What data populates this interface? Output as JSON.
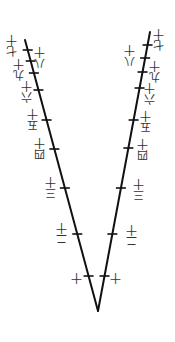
{
  "diagram": {
    "line_color": "#111111",
    "vertex": [
      98,
      311
    ],
    "left_arm_top": [
      25,
      40
    ],
    "right_arm_top": [
      150,
      32
    ],
    "left_ticks": [
      {
        "y": 50,
        "x": 28
      },
      {
        "y": 61,
        "x": 31
      },
      {
        "y": 73,
        "x": 34
      },
      {
        "y": 90,
        "x": 39
      },
      {
        "y": 120,
        "x": 47
      },
      {
        "y": 149,
        "x": 55
      },
      {
        "y": 188,
        "x": 65
      },
      {
        "y": 234,
        "x": 78
      },
      {
        "y": 276,
        "x": 89
      }
    ],
    "right_ticks": [
      {
        "y": 45,
        "x": 147
      },
      {
        "y": 58,
        "x": 145
      },
      {
        "y": 72,
        "x": 143
      },
      {
        "y": 88,
        "x": 140
      },
      {
        "y": 120,
        "x": 134
      },
      {
        "y": 148,
        "x": 129
      },
      {
        "y": 188,
        "x": 121
      },
      {
        "y": 234,
        "x": 112
      },
      {
        "y": 276,
        "x": 105
      }
    ],
    "labels": [
      {
        "id": "l17",
        "chars": [
          "十",
          "七"
        ],
        "x": 12,
        "y": 34
      },
      {
        "id": "l18a",
        "chars": [
          "十",
          "八"
        ],
        "x": 40,
        "y": 46
      },
      {
        "id": "l19",
        "chars": [
          "十",
          "九"
        ],
        "x": 19,
        "y": 58
      },
      {
        "id": "l16",
        "chars": [
          "十",
          "六"
        ],
        "x": 27,
        "y": 80
      },
      {
        "id": "l15",
        "chars": [
          "十",
          "五"
        ],
        "x": 33,
        "y": 108
      },
      {
        "id": "l14",
        "chars": [
          "十",
          "四"
        ],
        "x": 40,
        "y": 137
      },
      {
        "id": "l13",
        "chars": [
          "十",
          "三"
        ],
        "x": 51,
        "y": 176
      },
      {
        "id": "l12",
        "chars": [
          "十",
          "二"
        ],
        "x": 62,
        "y": 222
      },
      {
        "id": "l10",
        "chars": [
          "十"
        ],
        "x": 77,
        "y": 272
      },
      {
        "id": "r17",
        "chars": [
          "十",
          "七"
        ],
        "x": 159,
        "y": 28
      },
      {
        "id": "r18",
        "chars": [
          "十",
          "八"
        ],
        "x": 130,
        "y": 44
      },
      {
        "id": "r19",
        "chars": [
          "十",
          "九"
        ],
        "x": 155,
        "y": 60
      },
      {
        "id": "r16",
        "chars": [
          "十",
          "六"
        ],
        "x": 150,
        "y": 82
      },
      {
        "id": "r15",
        "chars": [
          "十",
          "五"
        ],
        "x": 146,
        "y": 110
      },
      {
        "id": "r14",
        "chars": [
          "十",
          "四"
        ],
        "x": 143,
        "y": 138
      },
      {
        "id": "r13",
        "chars": [
          "十",
          "三"
        ],
        "x": 139,
        "y": 178
      },
      {
        "id": "r12",
        "chars": [
          "十",
          "二"
        ],
        "x": 132,
        "y": 224
      },
      {
        "id": "r10",
        "chars": [
          "十"
        ],
        "x": 116,
        "y": 272
      }
    ]
  }
}
